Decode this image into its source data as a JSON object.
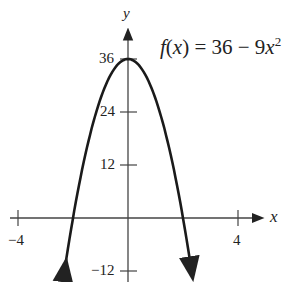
{
  "chart_data": {
    "type": "line",
    "title": "",
    "function_label": "f(x) = 36 − 9x²",
    "function_parts": {
      "name": "f",
      "var": "x",
      "rhs": "= 36 − 9",
      "exp": "2"
    },
    "xlabel": "x",
    "ylabel": "y",
    "xlim": [
      -4.3,
      4.6
    ],
    "ylim": [
      -13,
      40
    ],
    "x_ticks": [
      -4,
      4
    ],
    "x_tick_labels": [
      "−4",
      "4"
    ],
    "y_ticks": [
      36,
      24,
      12,
      -12
    ],
    "y_tick_labels": [
      "36",
      "24",
      "12",
      "−12"
    ],
    "grid": false,
    "series": [
      {
        "name": "f(x) = 36 − 9x²",
        "x": [
          -2.3,
          -2,
          -1.5,
          -1,
          -0.5,
          0,
          0.5,
          1,
          1.5,
          2,
          2.3
        ],
        "values": [
          -11.61,
          0,
          15.75,
          27,
          33.75,
          36,
          33.75,
          27,
          15.75,
          0,
          -11.61
        ]
      }
    ],
    "color": "#1a1a1a"
  }
}
